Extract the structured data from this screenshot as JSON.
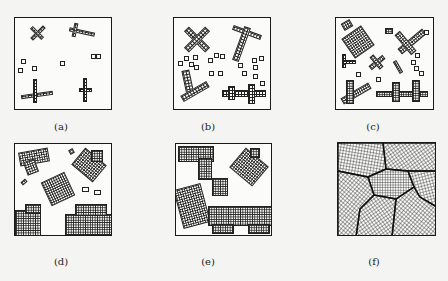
{
  "figure": {
    "panels": [
      {
        "id": "a",
        "label": "(a)",
        "description": "Initial nuclei: a few small cross-shaped crystals and isolated unit cells"
      },
      {
        "id": "b",
        "label": "(b)",
        "description": "Crystals grow larger; more nuclei appear"
      },
      {
        "id": "c",
        "label": "(c)",
        "description": "Many crystals of various sizes growing"
      },
      {
        "id": "d",
        "label": "(d)",
        "description": "Crystals grow into larger blocks, begin to impinge"
      },
      {
        "id": "e",
        "label": "(e)",
        "description": "Crystals nearly fill the space"
      },
      {
        "id": "f",
        "label": "(f)",
        "description": "Completed polycrystalline structure with grain boundaries"
      }
    ]
  },
  "colors": {
    "ink": "#1a1a1a",
    "paper": "#f4f4f2"
  }
}
